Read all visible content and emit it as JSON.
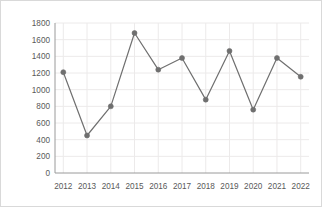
{
  "chart_data": {
    "type": "line",
    "title": "",
    "subtitle": "",
    "xlabel": "",
    "ylabel": "",
    "categories": [
      "2012",
      "2013",
      "2014",
      "2015",
      "2016",
      "2017",
      "2018",
      "2019",
      "2020",
      "2021",
      "2022"
    ],
    "values": [
      1210,
      450,
      800,
      1680,
      1240,
      1380,
      880,
      1465,
      760,
      1380,
      1155
    ],
    "series": [
      {
        "name": "",
        "values": [
          1210,
          450,
          800,
          1680,
          1240,
          1380,
          880,
          1465,
          760,
          1380,
          1155
        ]
      }
    ],
    "ylim": [
      0,
      1800
    ],
    "ytick_labels": [
      "0",
      "200",
      "400",
      "600",
      "800",
      "1000",
      "1200",
      "1400",
      "1600",
      "1800"
    ],
    "ytick_values": [
      0,
      200,
      400,
      600,
      800,
      1000,
      1200,
      1400,
      1600,
      1800
    ],
    "xtick_labels": [
      "2012",
      "2013",
      "2014",
      "2015",
      "2016",
      "2017",
      "2018",
      "2019",
      "2020",
      "2021",
      "2022"
    ],
    "grid": true,
    "grid_x": true,
    "grid_y": true,
    "legend": false,
    "legend_position": "none",
    "marker": "circle",
    "annotations": []
  },
  "style": {
    "line_color": "#6f6f6f",
    "marker_color": "#6f6f6f",
    "grid_color": "#eceaea",
    "axis_color": "#9a9a9a",
    "tick_label_color": "#595959",
    "background_color": "#ffffff",
    "border_color": "#d9d9d9"
  }
}
